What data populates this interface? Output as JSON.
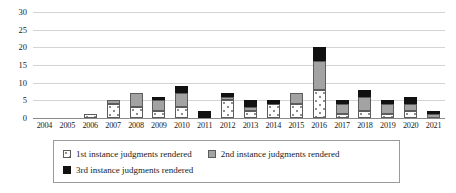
{
  "chart_data": {
    "type": "bar",
    "stacked": true,
    "title": "",
    "subtitle": "",
    "xlabel": "",
    "ylabel": "",
    "ylim": [
      0,
      30
    ],
    "ytick_labels": [
      "30",
      "25",
      "20",
      "15",
      "10",
      "5",
      "0"
    ],
    "ytick_values": [
      30,
      25,
      20,
      15,
      10,
      5,
      0
    ],
    "grid": true,
    "legend_position": "bottom",
    "categories": [
      "2004",
      "2005",
      "2006",
      "2007",
      "2008",
      "2009",
      "2010",
      "2011",
      "2012",
      "2013",
      "2014",
      "2015",
      "2016",
      "2017",
      "2018",
      "2019",
      "2020",
      "2021"
    ],
    "series": [
      {
        "name": "1st instance judgments rendered",
        "color": "#ffffff",
        "pattern": "dotted",
        "values": [
          0,
          0,
          1,
          4,
          3,
          2,
          3,
          0,
          5,
          2,
          4,
          4,
          8,
          1,
          2,
          1,
          2,
          0
        ]
      },
      {
        "name": "2nd instance judgments rendered",
        "color": "#a3a3a3",
        "pattern": "solid-gray",
        "values": [
          0,
          0,
          0,
          1,
          4,
          3,
          4,
          0,
          1,
          1,
          0,
          3,
          8,
          3,
          4,
          3,
          2,
          1
        ]
      },
      {
        "name": "3rd instance judgments rendered",
        "color": "#111111",
        "pattern": "solid-black",
        "values": [
          0,
          0,
          0,
          0,
          0,
          1,
          2,
          2,
          1,
          2,
          1,
          0,
          4,
          1,
          2,
          1,
          2,
          1
        ]
      }
    ],
    "totals": [
      0,
      0,
      1,
      5,
      7,
      6,
      9,
      2,
      7,
      5,
      5,
      7,
      20,
      5,
      8,
      5,
      6,
      2
    ]
  },
  "legend": {
    "items": [
      {
        "label": "1st instance judgments rendered",
        "swatch": "s1"
      },
      {
        "label": "2nd instance judgments rendered",
        "swatch": "s2"
      },
      {
        "label": "3rd instance judgments rendered",
        "swatch": "s3"
      }
    ]
  }
}
